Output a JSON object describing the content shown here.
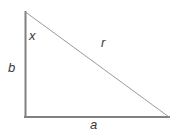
{
  "figure": {
    "type": "right-triangle-geometry-diagram",
    "background_color": "#ffffff",
    "stroke_color": "#808080",
    "hypotenuse_stroke_color": "#9a9a9a",
    "label_color": "#3a3a3a",
    "title": "",
    "vertices": {
      "apex": {
        "x": 25,
        "y": 12
      },
      "right_angle": {
        "x": 25,
        "y": 117
      },
      "base_right": {
        "x": 169,
        "y": 117
      }
    },
    "edges": [
      {
        "name": "vertical-leg",
        "label": "b",
        "from": "apex",
        "to": "right_angle",
        "stroke_width": 2
      },
      {
        "name": "horizontal-leg",
        "label": "a",
        "from": "right_angle",
        "to": "base_right",
        "stroke_width": 2
      },
      {
        "name": "hypotenuse",
        "label": "r",
        "from": "apex",
        "to": "base_right",
        "stroke_width": 1
      }
    ],
    "angles": [
      {
        "name": "apex-angle",
        "label": "x",
        "at": "apex"
      }
    ],
    "labels": {
      "angle_x": "x",
      "side_b": "b",
      "side_r": "r",
      "side_a": "a"
    }
  }
}
